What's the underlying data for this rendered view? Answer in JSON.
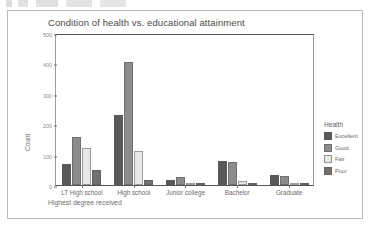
{
  "figure": {
    "title": "Condition of health vs. educational attainment",
    "xlabel": "Highest degree received",
    "ylabel": "Count",
    "legend_title": "Health"
  },
  "chart_data": {
    "type": "bar",
    "title": "Condition of health vs. educational attainment",
    "xlabel": "Highest degree received",
    "ylabel": "Count",
    "ylim": [
      0,
      500
    ],
    "yticks": [
      0,
      100,
      200,
      300,
      400,
      500
    ],
    "grid": false,
    "legend_position": "right",
    "legend_title": "Health",
    "categories": [
      "LT High school",
      "High school",
      "Junior college",
      "Bachelor",
      "Graduate"
    ],
    "series": [
      {
        "name": "Excellent",
        "color": "#595959",
        "values": [
          68,
          230,
          17,
          80,
          34
        ]
      },
      {
        "name": "Good",
        "color": "#8c8c8c",
        "values": [
          157,
          405,
          25,
          75,
          30
        ]
      },
      {
        "name": "Fair",
        "color": "#e8e8e8",
        "values": [
          123,
          113,
          8,
          12,
          3
        ]
      },
      {
        "name": "Poor",
        "color": "#707070",
        "values": [
          50,
          18,
          1,
          2,
          1
        ]
      }
    ]
  },
  "axis": {
    "yticks": [
      "500",
      "400",
      "300",
      "200",
      "100",
      "0"
    ]
  }
}
